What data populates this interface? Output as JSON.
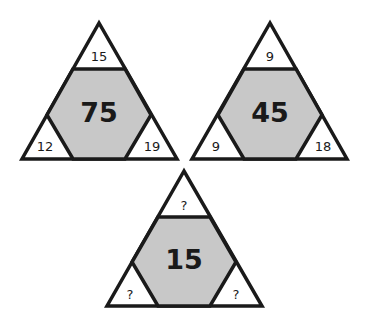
{
  "puzzle": {
    "triangles": [
      {
        "center": "75",
        "top": "15",
        "left": "12",
        "right": "19"
      },
      {
        "center": "45",
        "top": "9",
        "left": "9",
        "right": "18"
      },
      {
        "center": "15",
        "top": "?",
        "left": "?",
        "right": "?"
      }
    ],
    "colors": {
      "hexagon_fill": "#c8c8c8",
      "stroke": "#1a1a1a",
      "background": "#ffffff"
    }
  }
}
